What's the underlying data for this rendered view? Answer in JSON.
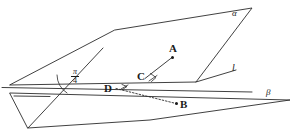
{
  "figure": {
    "kind": "solid-geometry-diagram",
    "stroke_color": "#2b2b2b",
    "background_color": "#ffffff"
  },
  "labels": {
    "plane_alpha": "α",
    "plane_beta": "β",
    "line_l": "l",
    "point_a": "A",
    "point_b": "B",
    "point_c": "C",
    "point_d": "D"
  },
  "angle": {
    "numerator": "π",
    "denominator": "4",
    "value_text": "π/4"
  },
  "geometry": {
    "plane_alpha_vertices": "115,30 252,8 196,82 10,85",
    "plane_beta_vertices": "10,93 290,100 150,120 28,128",
    "edge_line": "10,88 252,92",
    "line_l": "196,82 235,70",
    "segment_ca": "145,78 173,57",
    "segment_db": "113,88 178,104",
    "point_a_dot": "173,57",
    "point_b_dot": "178,104",
    "point_c": "145,78",
    "point_d": "113,88"
  }
}
